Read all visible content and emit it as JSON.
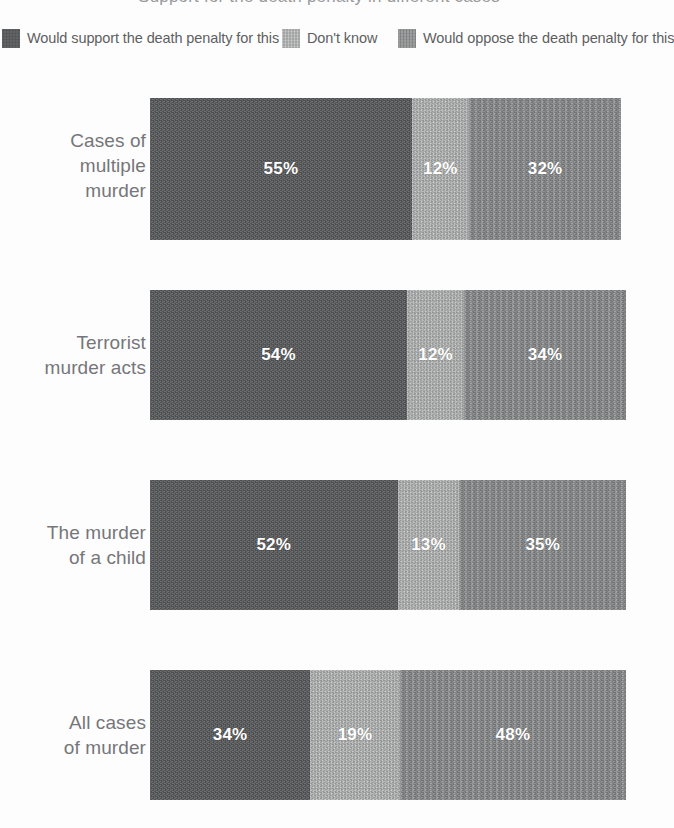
{
  "title": "Support for the death penalty in different cases",
  "legend": {
    "items": [
      {
        "label": "Would support the death penalty for this",
        "swatch": "swatch-dark",
        "color": "#57585a",
        "left": 2
      },
      {
        "label": "Don't know",
        "swatch": "swatch-light",
        "color": "#b8b9b9",
        "left": 282
      },
      {
        "label": "Would oppose the death penalty for this",
        "swatch": "swatch-mid",
        "color": "#8b8c8d",
        "left": 398
      }
    ]
  },
  "chart_data": {
    "type": "bar",
    "orientation": "horizontal",
    "stacked": true,
    "normalized_percent": true,
    "title": "Support for the death penalty in different cases",
    "xlabel": "",
    "ylabel": "",
    "xlim": [
      0,
      100
    ],
    "grid": false,
    "legend_position": "top",
    "categories": [
      "Cases of multiple murder",
      "Terrorist murder acts",
      "The murder of a child",
      "All cases of murder"
    ],
    "category_lines": [
      [
        "Cases of",
        "multiple",
        "murder"
      ],
      [
        "Terrorist",
        "murder acts"
      ],
      [
        "The murder",
        "of a child"
      ],
      [
        "All cases",
        "of murder"
      ]
    ],
    "series": [
      {
        "name": "Would support the death penalty for this",
        "color": "#57585a",
        "values": [
          55,
          54,
          52,
          34
        ]
      },
      {
        "name": "Don't know",
        "color": "#b8b9b9",
        "values": [
          12,
          12,
          13,
          19
        ]
      },
      {
        "name": "Would oppose the death penalty for this",
        "color": "#8b8c8d",
        "values": [
          32,
          34,
          35,
          48
        ]
      }
    ],
    "value_labels": [
      [
        "55%",
        "12%",
        "32%"
      ],
      [
        "54%",
        "12%",
        "34%"
      ],
      [
        "52%",
        "13%",
        "35%"
      ],
      [
        "34%",
        "19%",
        "48%"
      ]
    ]
  },
  "rows": [
    {
      "name": "cases-of-multiple-murder",
      "top": 98,
      "height": 142,
      "label_top": 128,
      "label_lines": [
        "Cases of",
        "multiple",
        "murder"
      ],
      "segments": [
        {
          "value": 55,
          "text": "55%",
          "style": "tex-dark"
        },
        {
          "value": 12,
          "text": "12%",
          "style": "tex-light"
        },
        {
          "value": 32,
          "text": "32%",
          "style": "tex-mid"
        }
      ]
    },
    {
      "name": "terrorist-murder-acts",
      "top": 290,
      "height": 130,
      "label_top": 330,
      "label_lines": [
        "Terrorist",
        "murder acts"
      ],
      "segments": [
        {
          "value": 54,
          "text": "54%",
          "style": "tex-dark"
        },
        {
          "value": 12,
          "text": "12%",
          "style": "tex-light"
        },
        {
          "value": 34,
          "text": "34%",
          "style": "tex-mid"
        }
      ]
    },
    {
      "name": "the-murder-of-a-child",
      "top": 480,
      "height": 130,
      "label_top": 520,
      "label_lines": [
        "The murder",
        "of a child"
      ],
      "segments": [
        {
          "value": 52,
          "text": "52%",
          "style": "tex-dark"
        },
        {
          "value": 13,
          "text": "13%",
          "style": "tex-light"
        },
        {
          "value": 35,
          "text": "35%",
          "style": "tex-mid"
        }
      ]
    },
    {
      "name": "all-cases-of-murder",
      "top": 670,
      "height": 130,
      "label_top": 710,
      "label_lines": [
        "All cases",
        "of murder"
      ],
      "segments": [
        {
          "value": 34,
          "text": "34%",
          "style": "tex-dark"
        },
        {
          "value": 19,
          "text": "19%",
          "style": "tex-light"
        },
        {
          "value": 48,
          "text": "48%",
          "style": "tex-mid"
        }
      ]
    }
  ]
}
